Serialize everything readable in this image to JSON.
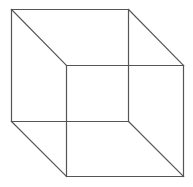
{
  "figure": {
    "type": "wireframe-cube",
    "width": 193,
    "height": 187,
    "background": "#ffffff",
    "stroke_color": "#555555",
    "stroke_width": 1.2
  },
  "vertices": {
    "back_top_left": [
      11.5,
      9.5
    ],
    "back_top_right": [
      128.5,
      9.5
    ],
    "back_bottom_left": [
      11.5,
      121.5
    ],
    "back_bottom_right": [
      128.5,
      121.5
    ],
    "front_top_left": [
      66.5,
      65.5
    ],
    "front_top_right": [
      183.5,
      65.5
    ],
    "front_bottom_left": [
      66.5,
      176.5
    ],
    "front_bottom_right": [
      183.5,
      176.5
    ]
  },
  "edges": [
    [
      "back_top_left",
      "back_top_right"
    ],
    [
      "back_top_right",
      "back_bottom_right"
    ],
    [
      "back_bottom_right",
      "back_bottom_left"
    ],
    [
      "back_bottom_left",
      "back_top_left"
    ],
    [
      "front_top_left",
      "front_top_right"
    ],
    [
      "front_top_right",
      "front_bottom_right"
    ],
    [
      "front_bottom_right",
      "front_bottom_left"
    ],
    [
      "front_bottom_left",
      "front_top_left"
    ],
    [
      "back_top_left",
      "front_top_left"
    ],
    [
      "back_top_right",
      "front_top_right"
    ],
    [
      "back_bottom_left",
      "front_bottom_left"
    ],
    [
      "back_bottom_right",
      "front_bottom_right"
    ]
  ]
}
